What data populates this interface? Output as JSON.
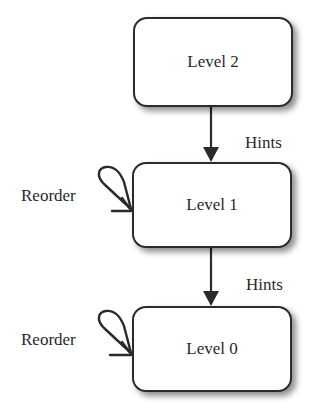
{
  "diagram": {
    "type": "state-hierarchy",
    "nodes": [
      {
        "id": "level2",
        "label": "Level 2"
      },
      {
        "id": "level1",
        "label": "Level 1"
      },
      {
        "id": "level0",
        "label": "Level 0"
      }
    ],
    "edges": [
      {
        "from": "level2",
        "to": "level1",
        "label": "Hints"
      },
      {
        "from": "level1",
        "to": "level0",
        "label": "Hints"
      },
      {
        "from": "level1",
        "to": "level1",
        "label": "Reorder"
      },
      {
        "from": "level0",
        "to": "level0",
        "label": "Reorder"
      }
    ],
    "colors": {
      "stroke": "#2b2b2b",
      "fill": "#ffffff",
      "text": "#2a2a2a"
    }
  }
}
